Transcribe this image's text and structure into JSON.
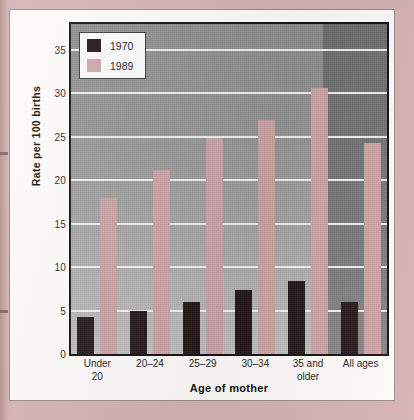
{
  "chart_data": {
    "type": "bar",
    "title": "",
    "xlabel": "Age of mother",
    "ylabel": "Rate per 100 births",
    "categories": [
      "Under 20",
      "20–24",
      "25–29",
      "30–34",
      "35 and older",
      "All ages"
    ],
    "series": [
      {
        "name": "1970",
        "color": "#241515",
        "values": [
          4.3,
          5.0,
          6.0,
          7.4,
          8.4,
          6.0
        ]
      },
      {
        "name": "1989",
        "color": "#cfa5a8",
        "values": [
          18.0,
          21.2,
          24.9,
          27.0,
          30.6,
          24.3
        ]
      }
    ],
    "ylim": [
      0,
      38
    ],
    "yticks": [
      0,
      5,
      10,
      15,
      20,
      25,
      30,
      35
    ],
    "ytick_labels": [
      "0",
      "5",
      "10",
      "15",
      "20",
      "25",
      "30",
      "35"
    ],
    "grid": true,
    "legend_position": "top-left"
  },
  "axis": {
    "y_title": "Rate per 100 births",
    "x_title": "Age of mother"
  },
  "legend": {
    "entries": [
      {
        "label": "1970",
        "color": "#241515"
      },
      {
        "label": "1989",
        "color": "#cfa5a8"
      }
    ]
  },
  "xtick_lines": [
    [
      "Under",
      "20"
    ],
    [
      "20–24",
      ""
    ],
    [
      "25–29",
      ""
    ],
    [
      "30–34",
      ""
    ],
    [
      "35 and",
      "older"
    ],
    [
      "All ages",
      ""
    ]
  ],
  "colors": {
    "series_1970": "#241515",
    "series_1989": "#cfa5a8",
    "plot_background": "#9a9a9a",
    "plot_background_dark": "#767676",
    "gridline": "#f4f4f4",
    "page_background": "#d6b2b2",
    "card_background": "#fdfbfa"
  }
}
